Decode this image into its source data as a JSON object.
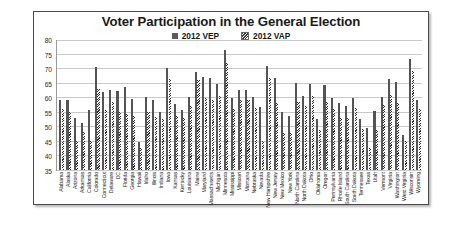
{
  "chart_data": {
    "type": "bar",
    "title": "Voter Participation in the General Election",
    "xlabel": "",
    "ylabel": "",
    "ylim": [
      35,
      80
    ],
    "yticks": [
      80,
      75,
      70,
      65,
      60,
      55,
      50,
      45,
      40,
      35
    ],
    "grid": true,
    "legend_position": "top-center",
    "categories": [
      "Alabama",
      "Alaska",
      "Arizona",
      "Arkansas",
      "California",
      "Colorado",
      "Connecticut",
      "Delaware",
      "DC",
      "Florida",
      "Georgia",
      "Hawaii",
      "Idaho",
      "Illinois",
      "Indiana",
      "Iowa",
      "Kansas",
      "Kentucky",
      "Louisiana",
      "Maine",
      "Maryland",
      "Massachusetts",
      "Michigan",
      "Minnesota",
      "Mississippi",
      "Missouri",
      "Montana",
      "Nebraska",
      "Nevada",
      "New Hampshire",
      "New Jersey",
      "New Mexico",
      "New York",
      "North Carolina",
      "North Dakota",
      "Ohio",
      "Oklahoma",
      "Oregon",
      "Pennsylvania",
      "Rhode Island",
      "South Carolina",
      "South Dakota",
      "Tennessee",
      "Texas",
      "Utah",
      "Vermont",
      "Virginia",
      "Washington",
      "West Virginia",
      "Wisconsin",
      "Wyoming"
    ],
    "series": [
      {
        "name": "2012 VEP",
        "color": "#545454",
        "values": [
          59.1,
          58.9,
          53.0,
          51.1,
          55.6,
          70.3,
          61.9,
          62.6,
          62.0,
          63.5,
          59.5,
          44.5,
          60.0,
          59.1,
          55.1,
          70.2,
          57.6,
          55.7,
          60.1,
          68.8,
          66.8,
          66.5,
          64.7,
          76.1,
          59.7,
          62.5,
          62.6,
          60.1,
          56.8,
          70.9,
          66.5,
          54.8,
          53.5,
          65.0,
          60.4,
          64.6,
          52.4,
          64.2,
          59.6,
          58.0,
          56.9,
          59.7,
          52.4,
          49.6,
          55.4,
          60.2,
          66.1,
          65.2,
          47.2,
          73.2,
          59.1
        ]
      },
      {
        "name": "2012 VAP",
        "color": "#2f2f2f",
        "values": [
          55.9,
          54.9,
          45.1,
          48.0,
          45.1,
          63.0,
          55.6,
          58.5,
          55.1,
          54.3,
          53.6,
          42.5,
          55.1,
          53.3,
          52.5,
          66.2,
          53.5,
          53.0,
          57.1,
          66.0,
          59.8,
          59.1,
          60.5,
          71.6,
          56.0,
          58.9,
          59.0,
          56.2,
          45.1,
          66.6,
          58.0,
          47.6,
          47.6,
          58.4,
          57.1,
          60.5,
          48.6,
          58.5,
          55.8,
          52.7,
          53.0,
          56.4,
          49.0,
          42.5,
          48.7,
          57.5,
          60.6,
          57.9,
          45.0,
          69.0,
          56.0
        ]
      }
    ]
  },
  "legend": {
    "items": [
      {
        "label": "2012 VEP",
        "marker": "solid-square"
      },
      {
        "label": "2012 VAP",
        "marker": "hatched-square"
      }
    ]
  }
}
